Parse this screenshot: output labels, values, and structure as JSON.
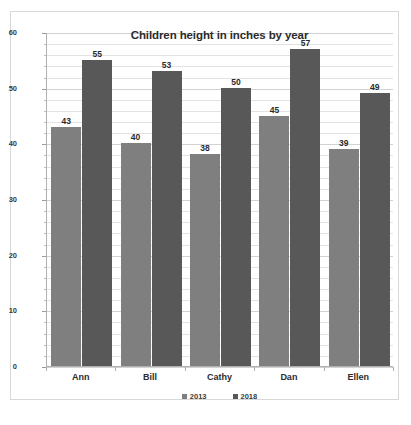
{
  "chart_data": {
    "type": "bar",
    "title": "Children height in inches by year",
    "xlabel": "",
    "ylabel": "",
    "categories": [
      "Ann",
      "Bill",
      "Cathy",
      "Dan",
      "Ellen"
    ],
    "series": [
      {
        "name": "2013",
        "values": [
          43,
          40,
          38,
          45,
          39
        ],
        "color": "#7f7f7f"
      },
      {
        "name": "2018",
        "values": [
          55,
          53,
          50,
          57,
          49
        ],
        "color": "#585858"
      }
    ],
    "ylim": [
      0,
      60
    ],
    "y_ticks": [
      0,
      10,
      20,
      30,
      40,
      50,
      60
    ],
    "y_tick_labels": [
      "0",
      "10",
      "20",
      "30",
      "40",
      "50",
      "60"
    ],
    "minor_gridline_step": 2,
    "grid": true,
    "legend_position": "bottom",
    "data_labels": true
  }
}
